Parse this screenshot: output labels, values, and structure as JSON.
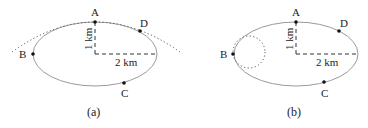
{
  "colors": {
    "ellipse": "#9a9a9a",
    "dotted": "#555555",
    "dashed": "#333333",
    "point": "#111111",
    "text": "#222222"
  },
  "panels": [
    {
      "caption": "(a)",
      "points": {
        "A": "A",
        "B": "B",
        "C": "C",
        "D": "D"
      },
      "semi_minor_label": "1 km",
      "semi_major_label": "2 km",
      "overlay": "dotted parabola through A and D"
    },
    {
      "caption": "(b)",
      "points": {
        "A": "A",
        "B": "B",
        "C": "C",
        "D": "D"
      },
      "semi_minor_label": "1 km",
      "semi_major_label": "2 km",
      "overlay": "dotted circle tangent at B"
    }
  ]
}
